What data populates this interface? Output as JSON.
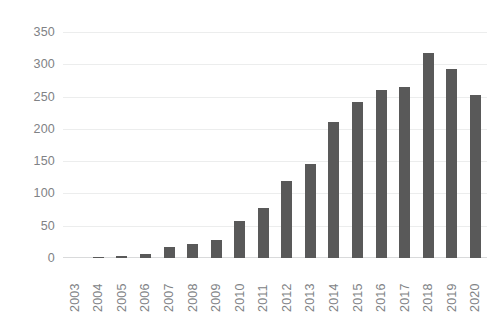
{
  "chart_data": {
    "type": "bar",
    "title": "",
    "subtitle": "",
    "xlabel": "",
    "ylabel": "",
    "categories": [
      "2003",
      "2004",
      "2005",
      "2006",
      "2007",
      "2008",
      "2009",
      "2010",
      "2011",
      "2012",
      "2013",
      "2014",
      "2015",
      "2016",
      "2017",
      "2018",
      "2019",
      "2020"
    ],
    "values": [
      0,
      2,
      3,
      6,
      17,
      21,
      28,
      57,
      78,
      119,
      146,
      211,
      241,
      260,
      265,
      318,
      292,
      252
    ],
    "series": [
      {
        "name": "",
        "values": [
          0,
          2,
          3,
          6,
          17,
          21,
          28,
          57,
          78,
          119,
          146,
          211,
          241,
          260,
          265,
          318,
          292,
          252
        ]
      }
    ],
    "ylim": [
      0,
      350
    ],
    "y_ticks": [
      0,
      50,
      100,
      150,
      200,
      250,
      300,
      350
    ],
    "y_tick_labels": [
      "0",
      "50",
      "100",
      "150",
      "200",
      "250",
      "300",
      "350"
    ],
    "grid": true,
    "grid_axis": "y",
    "legend": false,
    "legend_position": "none",
    "bar_color": "#595959",
    "grid_color": "#eceded",
    "axis_label_color": "#808285",
    "background_color": "#ffffff",
    "x_tick_rotation": 90
  }
}
